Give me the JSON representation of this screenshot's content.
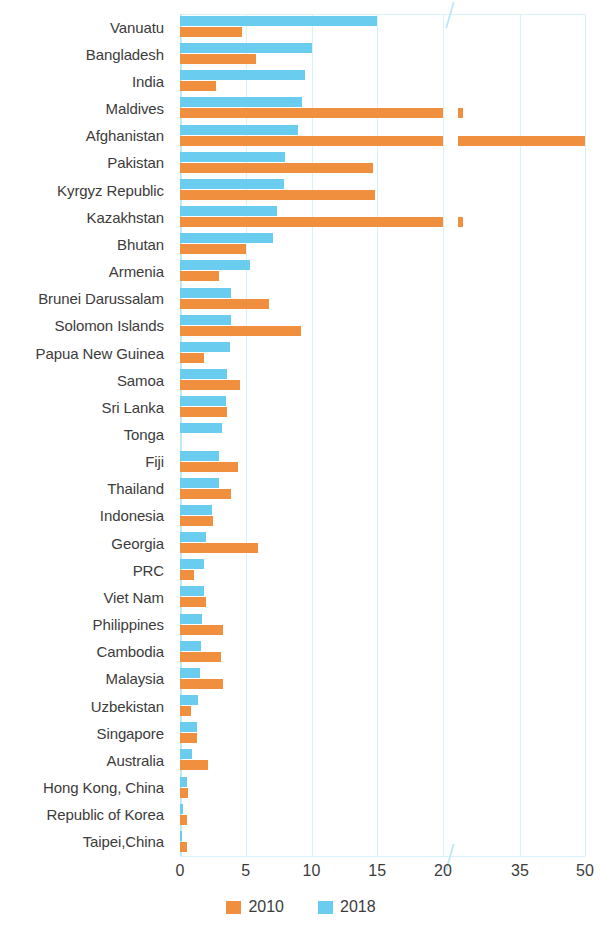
{
  "chart_data": {
    "type": "bar",
    "orientation": "horizontal",
    "title": "",
    "subtitle": "",
    "xlabel": "",
    "ylabel": "",
    "grid": true,
    "legend_position": "bottom",
    "axis_break": true,
    "xticks": [
      0,
      5,
      10,
      15,
      20,
      35,
      50
    ],
    "xtick_labels": [
      "0",
      "5",
      "10",
      "15",
      "20",
      "35",
      "50"
    ],
    "xlim": [
      0,
      50
    ],
    "categories": [
      "Vanuatu",
      "Bangladesh",
      "India",
      "Maldives",
      "Afghanistan",
      "Pakistan",
      "Kyrgyz Republic",
      "Kazakhstan",
      "Bhutan",
      "Armenia",
      "Brunei Darussalam",
      "Solomon Islands",
      "Papua New Guinea",
      "Samoa",
      "Sri Lanka",
      "Tonga",
      "Fiji",
      "Thailand",
      "Indonesia",
      "Georgia",
      "PRC",
      "Viet Nam",
      "Philippines",
      "Cambodia",
      "Malaysia",
      "Uzbekistan",
      "Singapore",
      "Australia",
      "Hong Kong, China",
      "Republic of Korea",
      "Taipei,China"
    ],
    "series": [
      {
        "name": "2010",
        "color": "#F0903F",
        "values": [
          4.7,
          5.8,
          2.7,
          21.2,
          50.0,
          14.7,
          14.8,
          21.2,
          5.0,
          3.0,
          6.8,
          9.2,
          1.8,
          4.6,
          3.6,
          0.0,
          4.4,
          3.9,
          2.5,
          5.9,
          1.1,
          2.0,
          3.3,
          3.1,
          3.3,
          0.8,
          1.3,
          2.1,
          0.6,
          0.5,
          0.5
        ]
      },
      {
        "name": "2018",
        "color": "#6ACDEF",
        "values": [
          15.0,
          10.0,
          9.5,
          9.3,
          9.0,
          8.0,
          7.9,
          7.4,
          7.1,
          5.3,
          3.9,
          3.9,
          3.8,
          3.6,
          3.5,
          3.2,
          3.0,
          3.0,
          2.4,
          2.0,
          1.8,
          1.8,
          1.7,
          1.6,
          1.5,
          1.4,
          1.3,
          0.9,
          0.5,
          0.2,
          0.15
        ]
      }
    ],
    "series_secondary_segment": {
      "note": "values beyond the axis break (>20) drawn in the compressed right panel",
      "Maldives": 21.2,
      "Afghanistan": 50.0,
      "Kazakhstan": 21.2
    }
  },
  "legend": {
    "items": [
      {
        "label": "2010",
        "color": "#F0903F"
      },
      {
        "label": "2018",
        "color": "#6ACDEF"
      }
    ]
  },
  "colors": {
    "series_2010": "#F0903F",
    "series_2018": "#6ACDEF",
    "gridline": "#d9f1fa",
    "text": "#3c3c3c",
    "background": "#ffffff"
  }
}
